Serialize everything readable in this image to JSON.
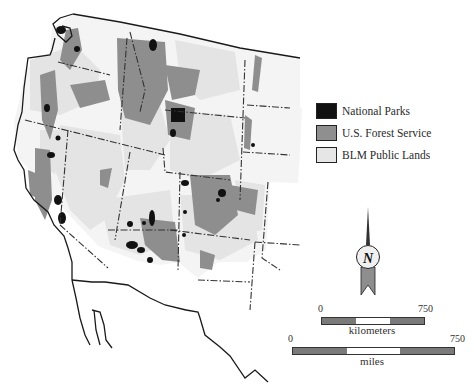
{
  "map": {
    "subject": "Federal lands of the western United States",
    "colors": {
      "background": "#ffffff",
      "national_parks": "#111111",
      "forest_service": "#8f8f8f",
      "blm": "#e6e6e6",
      "outline": "#1a1a1a",
      "state_border": "#333333"
    }
  },
  "legend": {
    "items": [
      {
        "label": "National Parks",
        "color": "#111111"
      },
      {
        "label": "U.S. Forest Service",
        "color": "#8f8f8f"
      },
      {
        "label": "BLM Public Lands",
        "color": "#e6e6e6"
      }
    ]
  },
  "compass": {
    "letter": "N",
    "icon": "north-arrow-icon"
  },
  "scale_bars": [
    {
      "unit": "kilometers",
      "start": "0",
      "end": "750"
    },
    {
      "unit": "miles",
      "start": "0",
      "end": "750"
    }
  ]
}
